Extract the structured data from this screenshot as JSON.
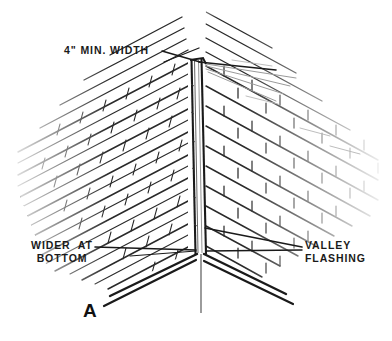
{
  "figure": {
    "id": "A",
    "background_color": "#ffffff",
    "ink_color": "#1a1a1a",
    "faint_ink_color": "#9a9a9a",
    "width": 392,
    "height": 341
  },
  "labels": {
    "min_width": "4\" MIN. WIDTH",
    "wider_at_bottom_line1": "WIDER  AT",
    "wider_at_bottom_line2": "BOTTOM",
    "valley_flashing_line1": "VALLEY",
    "valley_flashing_line2": "FLASHING",
    "figure_letter": "A"
  },
  "diagram_parts": [
    {
      "name": "left-roof-slope",
      "description": "Shingled roof plane descending from upper left to the valley, drawn as parallel course lines with short vertical tab slots"
    },
    {
      "name": "right-roof-slope",
      "description": "Shingled roof plane descending from upper right to the valley, drawn in staggered running-bond shingle pattern"
    },
    {
      "name": "valley-flashing",
      "description": "Narrow vertical metal channel running down the center where the two roof planes intersect, narrow at top and wider at bottom"
    },
    {
      "name": "valley-centerline",
      "description": "Thin vertical center line extending below the eave intersection"
    },
    {
      "name": "eave-edge-left",
      "description": "Double drip edge line along the bottom left eave"
    },
    {
      "name": "eave-edge-right",
      "description": "Double drip edge line along the bottom right eave"
    }
  ],
  "leaders": [
    {
      "name": "leader-min-width",
      "from_label": "min_width",
      "note": "Two crossed leader lines from the 4\" MIN. WIDTH text to the top of the valley"
    },
    {
      "name": "leader-wider-at-bottom",
      "from_label": "wider_at_bottom",
      "note": "Horizontal leader from WIDER AT BOTTOM text to the lower valley"
    },
    {
      "name": "leader-valley-flashing",
      "from_label": "valley_flashing",
      "note": "Two converging leader lines from VALLEY FLASHING text to the valley channel"
    }
  ]
}
